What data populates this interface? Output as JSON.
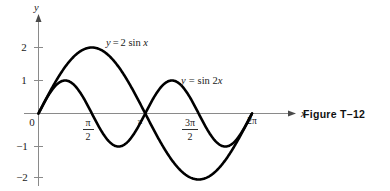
{
  "figure": {
    "caption": "Figure T–12"
  },
  "chart_data": {
    "type": "line",
    "title": "",
    "xlabel": "x",
    "ylabel": "y",
    "xlim": [
      0,
      6.283185307179586
    ],
    "ylim": [
      -2.4,
      2.4
    ],
    "grid": false,
    "legend_position": "inline-annotations",
    "x_ticks": [
      {
        "value": 0,
        "label": "0",
        "label_type": "plain"
      },
      {
        "value": 1.5707963,
        "label": "π/2",
        "label_type": "fraction",
        "numerator": "π",
        "denominator": "2"
      },
      {
        "value": 3.1415927,
        "label": "π",
        "label_type": "plain"
      },
      {
        "value": 4.712389,
        "label": "3π/2",
        "label_type": "fraction",
        "numerator": "3π",
        "denominator": "2"
      },
      {
        "value": 6.2831853,
        "label": "2π",
        "label_type": "plain"
      }
    ],
    "y_ticks": [
      {
        "value": 2,
        "label": "2"
      },
      {
        "value": 1,
        "label": "1"
      },
      {
        "value": -1,
        "label": "−1"
      },
      {
        "value": -2,
        "label": "−2"
      }
    ],
    "series": [
      {
        "name": "y = 2 sin x",
        "expression": "2*sin(x)",
        "amplitude": 2,
        "frequency": 1,
        "color": "#000000",
        "annotation": {
          "prefix": "y",
          "equals": "=",
          "body": "2 sin ",
          "var": "x"
        },
        "x": [
          0,
          0.3926991,
          0.7853982,
          1.1780972,
          1.5707963,
          1.9634954,
          2.3561945,
          2.7488936,
          3.1415927,
          3.5342917,
          3.9269908,
          4.3196899,
          4.712389,
          5.1050881,
          5.4977871,
          5.8904862,
          6.2831853
        ],
        "y": [
          0,
          0.7653669,
          1.4142136,
          1.847759,
          2,
          1.847759,
          1.4142136,
          0.7653669,
          0,
          -0.7653669,
          -1.4142136,
          -1.847759,
          -2,
          -1.847759,
          -1.4142136,
          -0.7653669,
          0
        ]
      },
      {
        "name": "y = sin 2x",
        "expression": "sin(2*x)",
        "amplitude": 1,
        "frequency": 2,
        "color": "#000000",
        "annotation": {
          "prefix": "y",
          "equals": "=",
          "body": "sin 2",
          "var": "x"
        },
        "x": [
          0,
          0.3926991,
          0.7853982,
          1.1780972,
          1.5707963,
          1.9634954,
          2.3561945,
          2.7488936,
          3.1415927,
          3.5342917,
          3.9269908,
          4.3196899,
          4.712389,
          5.1050881,
          5.4977871,
          5.8904862,
          6.2831853
        ],
        "y": [
          0,
          0.7071068,
          1,
          0.7071068,
          0,
          -0.7071068,
          -1,
          -0.7071068,
          0,
          0.7071068,
          1,
          0.7071068,
          0,
          -0.7071068,
          -1,
          -0.7071068,
          0
        ]
      }
    ],
    "annotations": [
      {
        "text": "y = 2 sin x",
        "x_px": 106,
        "y_px": 46,
        "for_series": "y = 2 sin x"
      },
      {
        "text": "y = sin 2x",
        "x_px": 181,
        "y_px": 84,
        "for_series": "y = sin 2x"
      }
    ]
  }
}
